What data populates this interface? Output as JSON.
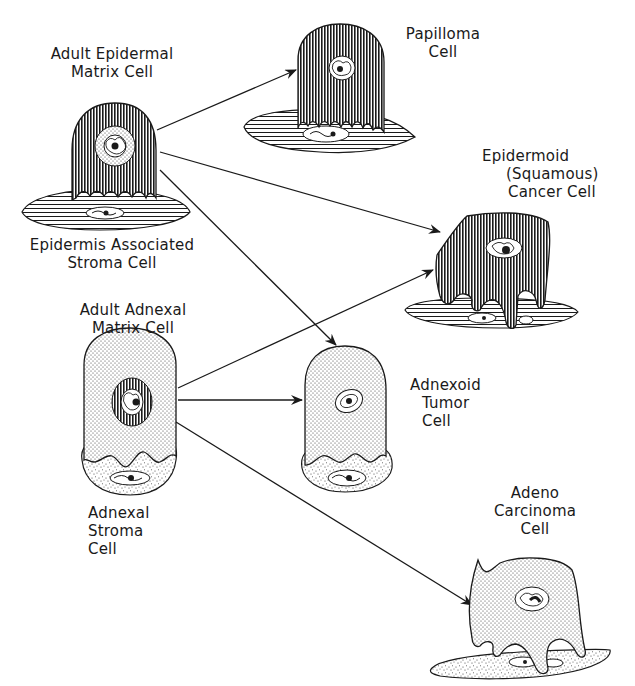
{
  "diagram": {
    "title": "",
    "colors": {
      "ink": "#1a1a1a",
      "background": "#ffffff",
      "dark_fill": "#5a5a5a",
      "stipple_fill": "#e6e6e6"
    },
    "nodes": [
      {
        "id": "adult_epidermal_matrix_cell",
        "lines": [
          "Adult Epidermal",
          "Matrix Cell"
        ],
        "pattern": "vertical-hatch",
        "nucleus": "stippled-ring"
      },
      {
        "id": "epidermis_associated_stroma_cell",
        "lines": [
          "Epidermis Associated",
          "Stroma Cell"
        ],
        "pattern": "horizontal-hatch"
      },
      {
        "id": "adult_adnexal_matrix_cell",
        "lines": [
          "Adult Adnexal",
          "Matrix Cell"
        ],
        "pattern": "stipple",
        "nucleus": "hatched-ring"
      },
      {
        "id": "adnexal_stroma_cell",
        "lines": [
          "Adnexal",
          "Stroma",
          "Cell"
        ],
        "pattern": "coarse-stipple"
      },
      {
        "id": "papilloma_cell",
        "lines": [
          "Papilloma",
          "Cell"
        ],
        "pattern": "vertical-hatch"
      },
      {
        "id": "epidermoid_squamous_cancer_cell",
        "lines": [
          "Epidermoid",
          "(Squamous)",
          "Cancer Cell"
        ],
        "pattern": "vertical-hatch"
      },
      {
        "id": "adnexoid_tumor_cell",
        "lines": [
          "Adnexoid",
          "Tumor",
          "Cell"
        ],
        "pattern": "stipple"
      },
      {
        "id": "adeno_carcinoma_cell",
        "lines": [
          "Adeno",
          "Carcinoma",
          "Cell"
        ],
        "pattern": "stipple"
      }
    ],
    "edges": [
      {
        "from": "adult_epidermal_matrix_cell",
        "to": "papilloma_cell"
      },
      {
        "from": "adult_epidermal_matrix_cell",
        "to": "epidermoid_squamous_cancer_cell"
      },
      {
        "from": "adult_epidermal_matrix_cell",
        "to": "adnexoid_tumor_cell"
      },
      {
        "from": "adult_adnexal_matrix_cell",
        "to": "epidermoid_squamous_cancer_cell"
      },
      {
        "from": "adult_adnexal_matrix_cell",
        "to": "adnexoid_tumor_cell"
      },
      {
        "from": "adult_adnexal_matrix_cell",
        "to": "adeno_carcinoma_cell"
      }
    ]
  },
  "labels": {
    "adult_epidermal": [
      "Adult Epidermal",
      "Matrix Cell"
    ],
    "epidermis_stroma": [
      "Epidermis Associated",
      "Stroma Cell"
    ],
    "adult_adnexal": [
      "Adult Adnexal",
      "Matrix Cell"
    ],
    "adnexal_stroma": [
      "Adnexal",
      "Stroma",
      "Cell"
    ],
    "papilloma": [
      "Papilloma",
      "Cell"
    ],
    "epidermoid": [
      "Epidermoid",
      "(Squamous)",
      "Cancer Cell"
    ],
    "adnexoid": [
      "Adnexoid",
      "Tumor",
      "Cell"
    ],
    "adeno": [
      "Adeno",
      "Carcinoma",
      "Cell"
    ]
  }
}
